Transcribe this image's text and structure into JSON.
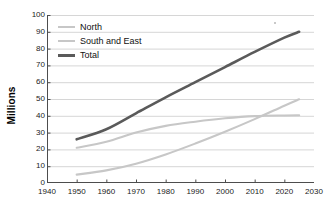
{
  "chart_data": {
    "type": "line",
    "title": "",
    "xlabel": "",
    "ylabel": "Millions",
    "xlim": [
      1940,
      2030
    ],
    "ylim": [
      0,
      100
    ],
    "xticks": [
      1940,
      1950,
      1960,
      1970,
      1980,
      1990,
      2000,
      2010,
      2020,
      2030
    ],
    "yticks": [
      0,
      10,
      20,
      30,
      40,
      50,
      60,
      70,
      80,
      90,
      100
    ],
    "grid": "horizontal",
    "legend_position": "top-left-inside",
    "x": [
      1950,
      1960,
      1970,
      1980,
      1990,
      2000,
      2010,
      2020,
      2025
    ],
    "series": [
      {
        "name": "North",
        "color": "#c7c7c7",
        "width": 2.1,
        "values": [
          21,
          24.5,
          30,
          34,
          36.5,
          38.5,
          39.8,
          40.2,
          40.3
        ]
      },
      {
        "name": "South and East",
        "color": "#c7c7c7",
        "width": 2.1,
        "values": [
          5,
          7.5,
          11.5,
          17,
          23.5,
          30.5,
          38,
          46,
          49.8
        ]
      },
      {
        "name": "Total",
        "color": "#5a5a5a",
        "width": 2.6,
        "values": [
          26,
          32,
          41.5,
          51,
          60,
          69,
          78,
          86.5,
          90
        ]
      }
    ]
  },
  "axes": {
    "ylabel": "Millions",
    "ytick_labels": [
      "100",
      "90",
      "80",
      "70",
      "60",
      "50",
      "40",
      "30",
      "20",
      "10",
      "0"
    ],
    "xtick_labels": [
      "1940",
      "1950",
      "1960",
      "1970",
      "1980",
      "1990",
      "2000",
      "2010",
      "2020",
      "2030"
    ]
  },
  "legend": {
    "items": [
      {
        "label": "North",
        "color": "#c7c7c7",
        "width": "2px"
      },
      {
        "label": "South and East",
        "color": "#c7c7c7",
        "width": "2px"
      },
      {
        "label": "Total",
        "color": "#5a5a5a",
        "width": "3px"
      }
    ]
  },
  "colors": {
    "grid": "#d6d6d6",
    "axis": "#4d4d4d",
    "text": "#1a1a1a",
    "background": "#ffffff"
  }
}
